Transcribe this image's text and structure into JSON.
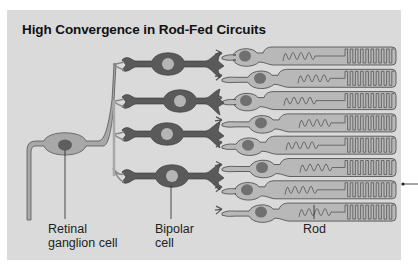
{
  "title": "High Convergence in Rod-Fed Circuits",
  "labels": {
    "ganglion": [
      "Retinal",
      "ganglion cell"
    ],
    "bipolar": [
      "Bipolar",
      "cell"
    ],
    "rod": "Rod"
  },
  "cells": {
    "rod_count": 8,
    "bipolar_count": 4,
    "ganglion_count": 1
  },
  "colors": {
    "background": "#dadada",
    "rod_fill": "#b8b8b8",
    "rod_outline": "#555555",
    "rod_nucleus": "#707070",
    "bipolar_fill": "#5a5a5a",
    "bipolar_nucleus": "#b5b5b5",
    "ganglion_fill": "#a8a8a8",
    "ganglion_nucleus": "#5e5e5e"
  }
}
